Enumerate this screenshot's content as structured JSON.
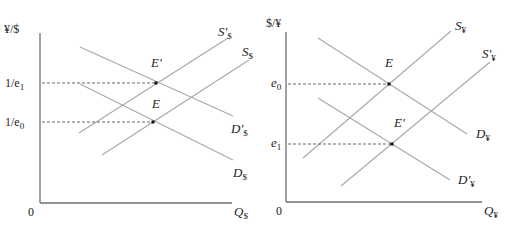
{
  "panels": [
    {
      "name": "dollar-market",
      "y_axis_label": "¥/$",
      "x_axis_label_main": "Q",
      "x_axis_label_sub": "$",
      "origin_label": "0",
      "ticks": [
        {
          "main": "1/e",
          "sub": "1"
        },
        {
          "main": "1/e",
          "sub": "0"
        }
      ],
      "curves": [
        {
          "id": "S-prime-dollar",
          "main": "S'",
          "sub": "$"
        },
        {
          "id": "S-dollar",
          "main": "S",
          "sub": "$"
        },
        {
          "id": "D-prime-dollar",
          "main": "D'",
          "sub": "$"
        },
        {
          "id": "D-dollar",
          "main": "D",
          "sub": "$"
        }
      ],
      "points": [
        {
          "id": "E-prime",
          "label": "E'"
        },
        {
          "id": "E",
          "label": "E"
        }
      ]
    },
    {
      "name": "yen-market",
      "y_axis_label": "$/¥",
      "x_axis_label_main": "Q",
      "x_axis_label_sub": "¥",
      "origin_label": "0",
      "ticks": [
        {
          "main": "e",
          "sub": "0"
        },
        {
          "main": "e",
          "sub": "1"
        }
      ],
      "curves": [
        {
          "id": "S-yen",
          "main": "S",
          "sub": "¥"
        },
        {
          "id": "S-prime-yen",
          "main": "S'",
          "sub": "¥"
        },
        {
          "id": "D-yen",
          "main": "D",
          "sub": "¥"
        },
        {
          "id": "D-prime-yen",
          "main": "D'",
          "sub": "¥"
        }
      ],
      "points": [
        {
          "id": "E",
          "label": "E"
        },
        {
          "id": "E-prime",
          "label": "E'"
        }
      ]
    }
  ]
}
